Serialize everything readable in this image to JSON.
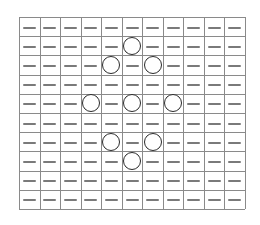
{
  "board": {
    "columns": 11,
    "rows": 10,
    "left": 19,
    "top": 17,
    "width": 226,
    "height": 192,
    "line_color": "#8a8a8a",
    "dash_color": "#7a7a7a",
    "circle_color": "#2a2a2a",
    "empty_symbol": "dash",
    "circles": [
      {
        "row": 1,
        "col": 5
      },
      {
        "row": 2,
        "col": 4
      },
      {
        "row": 2,
        "col": 6
      },
      {
        "row": 4,
        "col": 3
      },
      {
        "row": 4,
        "col": 5
      },
      {
        "row": 4,
        "col": 7
      },
      {
        "row": 6,
        "col": 4
      },
      {
        "row": 6,
        "col": 6
      },
      {
        "row": 7,
        "col": 5
      }
    ]
  }
}
